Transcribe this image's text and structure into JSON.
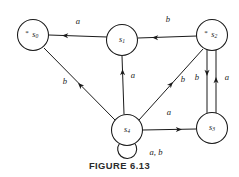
{
  "figure": {
    "caption": "FIGURE 6.13",
    "caption_y": 160
  },
  "diagram": {
    "type": "state-transition-diagram",
    "ink_color": "#1a1a1a",
    "background": "#ffffff",
    "node_radius": 15.5,
    "accept_mark": "*"
  },
  "states": [
    {
      "id": "s0",
      "label": "s",
      "subscript": "0",
      "mark": "*",
      "accepting": true,
      "cx": 33,
      "cy": 35
    },
    {
      "id": "s1",
      "label": "s",
      "subscript": "1",
      "mark": "",
      "accepting": false,
      "cx": 122,
      "cy": 40
    },
    {
      "id": "s2",
      "label": "s",
      "subscript": "2",
      "mark": "*",
      "accepting": true,
      "cx": 212,
      "cy": 35
    },
    {
      "id": "s3",
      "label": "s",
      "subscript": "3",
      "mark": "",
      "accepting": false,
      "cx": 212,
      "cy": 128
    },
    {
      "id": "s4",
      "label": "s",
      "subscript": "4",
      "mark": "",
      "accepting": false,
      "cx": 127,
      "cy": 130
    }
  ],
  "transitions": [
    {
      "id": "t1",
      "from": "s1",
      "to": "s0",
      "symbol": "a",
      "x1": 107,
      "y1": 37,
      "x2": 49,
      "y2": 35,
      "head_x": 62,
      "head_y": 35.5,
      "head_angle": 182,
      "label_x": 78,
      "label_y": 22
    },
    {
      "id": "t2",
      "from": "s2",
      "to": "s1",
      "symbol": "b",
      "x1": 197,
      "y1": 36,
      "x2": 138,
      "y2": 38,
      "head_x": 152,
      "head_y": 37.5,
      "head_angle": 182,
      "label_x": 168,
      "label_y": 20
    },
    {
      "id": "t3",
      "from": "s4",
      "to": "s1",
      "symbol": "a",
      "x1": 124,
      "y1": 114,
      "x2": 122,
      "y2": 56,
      "head_x": 122.5,
      "head_y": 69,
      "head_angle": 269,
      "label_x": 133,
      "label_y": 76
    },
    {
      "id": "t4",
      "from": "s4",
      "to": "s0",
      "symbol": "b",
      "x1": 115,
      "y1": 120,
      "x2": 44,
      "y2": 48,
      "head_x": 78,
      "head_y": 83,
      "head_angle": 225,
      "label_x": 65,
      "label_y": 82
    },
    {
      "id": "t5",
      "from": "s4",
      "to": "s2",
      "symbol": "b",
      "x1": 139,
      "y1": 120,
      "x2": 203,
      "y2": 49,
      "head_x": 173,
      "head_y": 82,
      "head_angle": 312,
      "label_x": 183,
      "label_y": 80
    },
    {
      "id": "t6",
      "from": "s4",
      "to": "s3",
      "symbol": "a",
      "x1": 143,
      "y1": 130,
      "x2": 196,
      "y2": 129,
      "head_x": 182,
      "head_y": 129.5,
      "head_angle": 0,
      "label_x": 169,
      "label_y": 113
    },
    {
      "id": "t7",
      "from": "s2",
      "to": "s3",
      "symbol": "b",
      "x1": 207,
      "y1": 50,
      "x2": 207,
      "y2": 114,
      "head_x": 207,
      "head_y": 76,
      "head_angle": 90,
      "label_x": 197,
      "label_y": 78
    },
    {
      "id": "t8",
      "from": "s3",
      "to": "s2",
      "symbol": "a",
      "x1": 216,
      "y1": 114,
      "x2": 216,
      "y2": 50,
      "head_x": 216,
      "head_y": 77,
      "head_angle": 270,
      "label_x": 227,
      "label_y": 78
    }
  ],
  "self_loops": [
    {
      "id": "t9",
      "on": "s4",
      "symbol": "a, b",
      "path": "M 119.5 143.5 A 9.5 9.5 0 1 0 134.5 143.0",
      "head_x": 134.0,
      "head_y": 144.5,
      "head_angle": 55,
      "label_x": 156,
      "label_y": 153
    }
  ]
}
